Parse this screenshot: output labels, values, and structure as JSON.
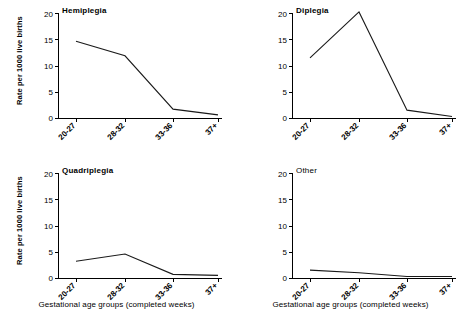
{
  "figure": {
    "width": 467,
    "height": 333,
    "background": "#ffffff",
    "line_color": "#1a1a1a",
    "axis_color": "#000000"
  },
  "axes": {
    "y_label": "Rate per 1000 live births",
    "x_label": "Gestational age groups (completed weeks)",
    "y_ticks": [
      "0",
      "5",
      "10",
      "15",
      "20"
    ],
    "x_ticks": [
      "20-27",
      "28-32",
      "33-36",
      "37+"
    ]
  },
  "panels": {
    "hemiplegia": {
      "title": "Hemiplegia",
      "title_bold": true
    },
    "diplegia": {
      "title": "Diplegia",
      "title_bold": true
    },
    "quadriplegia": {
      "title": "Quadriplegia",
      "title_bold": true
    },
    "other": {
      "title": "Other",
      "title_bold": false
    }
  },
  "chart_data": [
    {
      "type": "line",
      "title": "Hemiplegia",
      "xlabel": "Gestational age groups (completed weeks)",
      "ylabel": "Rate per 1000 live births",
      "categories": [
        "20-27",
        "28-32",
        "33-36",
        "37+"
      ],
      "values": [
        14.7,
        11.9,
        1.7,
        0.6
      ],
      "ylim": [
        0,
        20
      ],
      "yticks": [
        0,
        5,
        10,
        15,
        20
      ],
      "grid": false,
      "legend": "none"
    },
    {
      "type": "line",
      "title": "Diplegia",
      "xlabel": "Gestational age groups (completed weeks)",
      "ylabel": "Rate per 1000 live births",
      "categories": [
        "20-27",
        "28-32",
        "33-36",
        "37+"
      ],
      "values": [
        11.5,
        20.3,
        1.5,
        0.3
      ],
      "ylim": [
        0,
        20
      ],
      "yticks": [
        0,
        5,
        10,
        15,
        20
      ],
      "grid": false,
      "legend": "none"
    },
    {
      "type": "line",
      "title": "Quadriplegia",
      "xlabel": "Gestational age groups (completed weeks)",
      "ylabel": "Rate per 1000 live births",
      "categories": [
        "20-27",
        "28-32",
        "33-36",
        "37+"
      ],
      "values": [
        3.2,
        4.6,
        0.7,
        0.5
      ],
      "ylim": [
        0,
        20
      ],
      "yticks": [
        0,
        5,
        10,
        15,
        20
      ],
      "grid": false,
      "legend": "none"
    },
    {
      "type": "line",
      "title": "Other",
      "xlabel": "Gestational age groups (completed weeks)",
      "ylabel": "Rate per 1000 live births",
      "categories": [
        "20-27",
        "28-32",
        "33-36",
        "37+"
      ],
      "values": [
        1.5,
        1.0,
        0.3,
        0.3
      ],
      "ylim": [
        0,
        20
      ],
      "yticks": [
        0,
        5,
        10,
        15,
        20
      ],
      "grid": false,
      "legend": "none"
    }
  ]
}
